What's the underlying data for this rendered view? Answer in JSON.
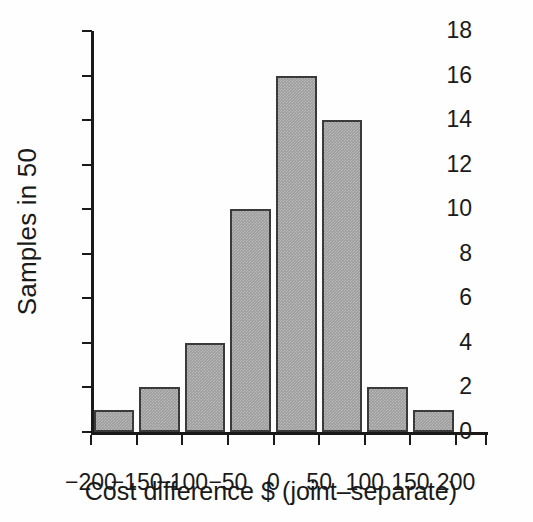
{
  "chart_data": {
    "type": "bar",
    "title": "",
    "subtitle": "",
    "xlabel": "Cost difference $ (joint–separate)",
    "ylabel": "Samples in 50",
    "grid": false,
    "legend": false,
    "legend_position": "none",
    "xlim": [
      -200,
      235
    ],
    "ylim": [
      0,
      18
    ],
    "xticks": [
      -200,
      -150,
      -100,
      -50,
      0,
      50,
      100,
      150,
      200
    ],
    "xtick_labels": [
      "−200",
      "−150",
      "−100",
      "−50",
      "0",
      "50",
      "100",
      "150",
      "200"
    ],
    "yticks": [
      0,
      2,
      4,
      6,
      8,
      10,
      12,
      14,
      16,
      18
    ],
    "ytick_labels": [
      "0",
      "2",
      "4",
      "6",
      "8",
      "10",
      "12",
      "14",
      "16",
      "18"
    ],
    "bin_width": 50,
    "categories": [
      "−200 to −150",
      "−150 to −100",
      "−100 to −50",
      "−50 to 0",
      "0 to 50",
      "50 to 100",
      "100 to 150",
      "150 to 200"
    ],
    "bin_starts": [
      -200,
      -150,
      -100,
      -50,
      0,
      50,
      100,
      150
    ],
    "values": [
      1,
      2,
      4,
      10,
      16,
      14,
      2,
      1
    ],
    "total": 50,
    "colors": {
      "bar_fill": "#9c9c9c",
      "bar_edge": "#3a3a3a",
      "axis": "#1a1a1a",
      "background": "#fefefe",
      "text": "#1a1a1a"
    }
  },
  "axes": {
    "y_title": "Samples in 50",
    "x_title": "Cost difference $ (joint–separate)"
  }
}
